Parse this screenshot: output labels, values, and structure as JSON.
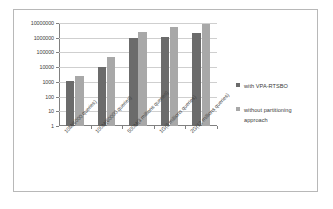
{
  "chart_data": {
    "type": "bar",
    "title": "",
    "xlabel": "",
    "ylabel": "",
    "yscale": "log",
    "ylim": [
      1,
      10000000
    ],
    "grid": true,
    "legend_position": "right",
    "ytick_labels": [
      "10000000",
      "1000000",
      "100000",
      "10000",
      "1000",
      "100",
      "10",
      "1"
    ],
    "ytick_values": [
      10000000,
      1000000,
      100000,
      10000,
      1000,
      100,
      10,
      1
    ],
    "categories": [
      "10M(6000 queries)",
      "100M(60000 queries)",
      "500M(3 millions queries)",
      "1G(6 millions queries)",
      "2G(12 millions queries)"
    ],
    "series": [
      {
        "name": "with VPA-RTSBO",
        "color": "#6b6b6b",
        "values": [
          1200,
          10000,
          900000,
          1100000,
          2000000
        ]
      },
      {
        "name": "without partitioning approach",
        "color": "#a8a8a8",
        "values": [
          2400,
          50000,
          2400000,
          5000000,
          9000000
        ]
      }
    ]
  },
  "legend": {
    "items": [
      {
        "label": "with VPA-RTSBO"
      },
      {
        "label": "without partitioning approach"
      }
    ]
  },
  "colors": {
    "series_0": "#6b6b6b",
    "series_1": "#a8a8a8",
    "axis": "#808080",
    "gridline": "#cfcfcf",
    "border": "#b8b8b8",
    "background": "#ffffff"
  }
}
